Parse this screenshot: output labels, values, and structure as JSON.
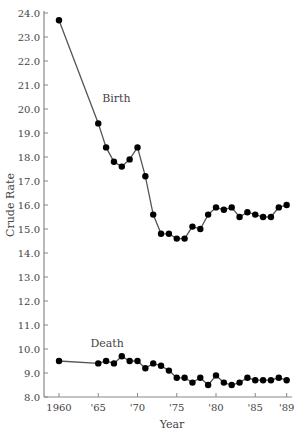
{
  "chart_data": {
    "type": "line",
    "title": "",
    "xlabel": "Year",
    "ylabel": "Crude Rate",
    "ylim": [
      8.0,
      24.0
    ],
    "xlim": [
      1960,
      1989
    ],
    "grid": false,
    "legend": "inline labels",
    "y_ticks": [
      "8.0",
      "9.0",
      "10.0",
      "11.0",
      "12.0",
      "13.0",
      "14.0",
      "15.0",
      "16.0",
      "17.0",
      "18.0",
      "19.0",
      "20.0",
      "21.0",
      "22.0",
      "23.0",
      "24.0"
    ],
    "x_ticks": [
      {
        "value": 1960,
        "label": "1960"
      },
      {
        "value": 1965,
        "label": "'65"
      },
      {
        "value": 1970,
        "label": "'70"
      },
      {
        "value": 1975,
        "label": "'75"
      },
      {
        "value": 1980,
        "label": "'80"
      },
      {
        "value": 1985,
        "label": "'85"
      },
      {
        "value": 1989,
        "label": "'89"
      }
    ],
    "x": [
      1960,
      1965,
      1966,
      1967,
      1968,
      1969,
      1970,
      1971,
      1972,
      1973,
      1974,
      1975,
      1976,
      1977,
      1978,
      1979,
      1980,
      1981,
      1982,
      1983,
      1984,
      1985,
      1986,
      1987,
      1988,
      1989
    ],
    "series": [
      {
        "name": "Birth",
        "values": [
          23.7,
          19.4,
          18.4,
          17.8,
          17.6,
          17.9,
          18.4,
          17.2,
          15.6,
          14.8,
          14.8,
          14.6,
          14.6,
          15.1,
          15.0,
          15.6,
          15.9,
          15.8,
          15.9,
          15.5,
          15.7,
          15.6,
          15.5,
          15.5,
          15.9,
          16.0
        ],
        "label_pos": {
          "x": 1965.5,
          "y": 20.3
        }
      },
      {
        "name": "Death",
        "values": [
          9.5,
          9.4,
          9.5,
          9.4,
          9.7,
          9.5,
          9.5,
          9.2,
          9.4,
          9.3,
          9.1,
          8.8,
          8.8,
          8.6,
          8.8,
          8.5,
          8.9,
          8.6,
          8.5,
          8.6,
          8.8,
          8.7,
          8.7,
          8.7,
          8.8,
          8.7
        ],
        "label_pos": {
          "x": 1964.0,
          "y": 10.1
        }
      }
    ]
  }
}
